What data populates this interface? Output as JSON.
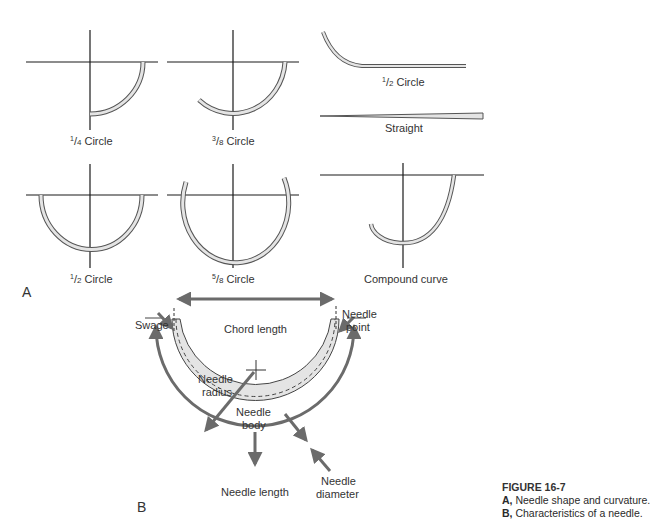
{
  "panel_a": {
    "label": "A",
    "shapes": [
      {
        "id": "quarter",
        "num": "1",
        "den": "4",
        "word": "Circle"
      },
      {
        "id": "three-eighths",
        "num": "3",
        "den": "8",
        "word": "Circle"
      },
      {
        "id": "half-ski",
        "num": "1",
        "den": "2",
        "word": "Circle"
      },
      {
        "id": "straight",
        "word": "Straight"
      },
      {
        "id": "half",
        "num": "1",
        "den": "2",
        "word": "Circle"
      },
      {
        "id": "five-eighths",
        "num": "5",
        "den": "8",
        "word": "Circle"
      },
      {
        "id": "compound",
        "word": "Compound curve"
      }
    ]
  },
  "panel_b": {
    "label": "B",
    "labels": {
      "swage": "Swage",
      "chord_length": "Chord length",
      "needle_point_1": "Needle",
      "needle_point_2": "point",
      "needle_radius_1": "Needle",
      "needle_radius_2": "radius",
      "needle_body_1": "Needle",
      "needle_body_2": "body",
      "needle_length": "Needle length",
      "needle_diameter_1": "Needle",
      "needle_diameter_2": "diameter"
    }
  },
  "caption": {
    "figure": "FIGURE 16-7",
    "a_key": "A,",
    "a_text": " Needle shape and curvature.",
    "b_key": "B,",
    "b_text": " Characteristics of a needle."
  },
  "colors": {
    "line": "#1a1a1a",
    "needle_fill": "#e4e4e4",
    "arrow": "#6b6b6b",
    "caption_accent": "#333333"
  }
}
